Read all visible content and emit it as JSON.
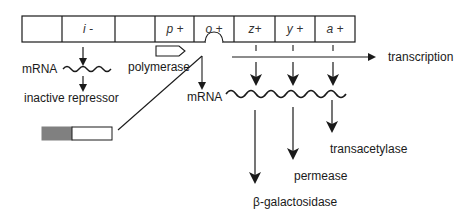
{
  "diagram": {
    "gene_segments": [
      {
        "label": "",
        "x": 22,
        "w": 40
      },
      {
        "label": "i -",
        "x": 62,
        "w": 53
      },
      {
        "label": "",
        "x": 115,
        "w": 40
      },
      {
        "label": "p +",
        "x": 155,
        "w": 39
      },
      {
        "label": "o +",
        "x": 194,
        "w": 40
      },
      {
        "label": "z+",
        "x": 234,
        "w": 41
      },
      {
        "label": "y +",
        "x": 275,
        "w": 40
      },
      {
        "label": "a +",
        "x": 315,
        "w": 40
      }
    ],
    "labels": {
      "mrna_left": "mRNA",
      "inactive_repressor": "inactive repressor",
      "polymerase": "polymerase",
      "transcription": "transcription",
      "mrna_right": "mRNA",
      "transacetylase": "transacetylase",
      "permease": "permease",
      "beta_galactosidase": "β-galactosidase"
    },
    "colors": {
      "line": "#1a1a1a",
      "repressor_fill": "#808080",
      "background": "#ffffff"
    }
  }
}
